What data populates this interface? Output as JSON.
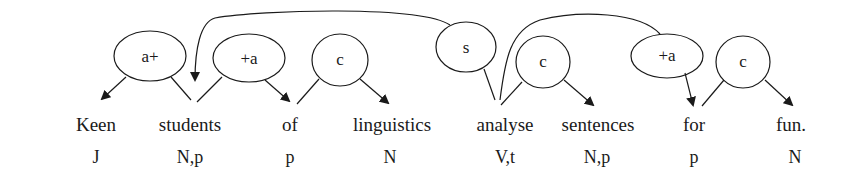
{
  "diagram": {
    "words": [
      {
        "text": "Keen",
        "tag": "J"
      },
      {
        "text": "students",
        "tag": "N,p"
      },
      {
        "text": "of",
        "tag": "p"
      },
      {
        "text": "linguistics",
        "tag": "N"
      },
      {
        "text": "analyse",
        "tag": "V,t"
      },
      {
        "text": "sentences",
        "tag": "N,p"
      },
      {
        "text": "for",
        "tag": "p"
      },
      {
        "text": "fun.",
        "tag": "N"
      }
    ],
    "relations": [
      {
        "label": "a+",
        "from": "students",
        "to": "Keen"
      },
      {
        "label": "+a",
        "from": "students",
        "to": "of"
      },
      {
        "label": "c",
        "from": "of",
        "to": "linguistics"
      },
      {
        "label": "s",
        "from": "analyse",
        "to": "students"
      },
      {
        "label": "c",
        "from": "analyse",
        "to": "sentences"
      },
      {
        "label": "+a",
        "from": "analyse",
        "to": "for"
      },
      {
        "label": "c",
        "from": "for",
        "to": "fun."
      }
    ]
  }
}
